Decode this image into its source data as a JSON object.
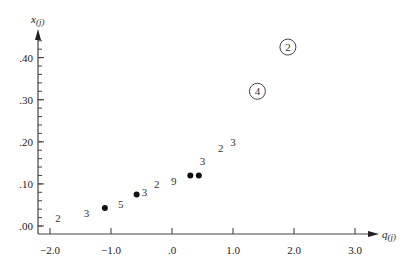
{
  "chart_data": {
    "type": "scatter",
    "title": "",
    "xlabel": "q(j)",
    "ylabel": "x(j)",
    "xlim": [
      -2.2,
      3.5
    ],
    "ylim": [
      -0.02,
      0.46
    ],
    "grid": false,
    "legend": null,
    "x_ticks": [
      -2.0,
      -1.0,
      0.0,
      1.0,
      2.0,
      3.0
    ],
    "x_tick_labels": [
      "−2.0",
      "−1.0",
      ".0",
      "1.0",
      "2.0",
      "3.0"
    ],
    "y_ticks": [
      0.0,
      0.1,
      0.2,
      0.3,
      0.4
    ],
    "y_tick_labels": [
      ".00",
      ".10",
      ".20",
      ".30",
      ".40"
    ],
    "y_minor_step": 0.02,
    "series": [
      {
        "name": "single observations (dots)",
        "marker": "dot",
        "points": [
          {
            "q": -1.1,
            "x": 0.043
          },
          {
            "q": -0.58,
            "x": 0.075
          },
          {
            "q": 0.3,
            "x": 0.12
          },
          {
            "q": 0.44,
            "x": 0.12
          }
        ]
      },
      {
        "name": "repeated observations (count labels)",
        "marker": "number",
        "points": [
          {
            "q": -1.87,
            "x": 0.02,
            "label": "2"
          },
          {
            "q": -1.4,
            "x": 0.03,
            "label": "3"
          },
          {
            "q": -0.84,
            "x": 0.052,
            "label": "5"
          },
          {
            "q": -0.45,
            "x": 0.08,
            "label": "3"
          },
          {
            "q": -0.25,
            "x": 0.1,
            "label": "2"
          },
          {
            "q": 0.03,
            "x": 0.106,
            "label": "9"
          },
          {
            "q": 0.5,
            "x": 0.155,
            "label": "3"
          },
          {
            "q": 0.8,
            "x": 0.185,
            "label": "2"
          },
          {
            "q": 1.0,
            "x": 0.2,
            "label": "3"
          }
        ]
      },
      {
        "name": "outliers (circled counts)",
        "marker": "circled-number",
        "points": [
          {
            "q": 1.4,
            "x": 0.32,
            "label": "4"
          },
          {
            "q": 1.9,
            "x": 0.425,
            "label": "2"
          }
        ]
      }
    ]
  },
  "axes": {
    "x_label_main": "q",
    "x_label_sub": "(j)",
    "y_label_main": "x",
    "y_label_sub": "(j)"
  }
}
